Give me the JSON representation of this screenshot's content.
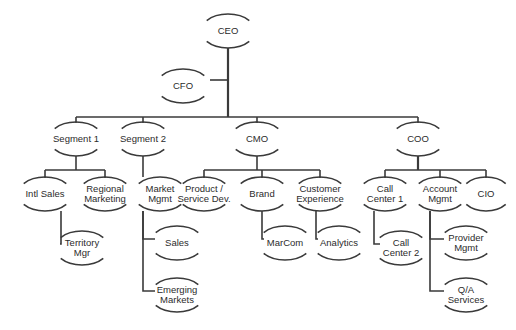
{
  "diagram": {
    "type": "org-chart",
    "canvas": {
      "width": 516,
      "height": 330
    },
    "style": {
      "background": "#ffffff",
      "line_color": "#3a3a3a",
      "text_color": "#2b2b2b",
      "line_width": 1.6,
      "trunk_width": 2.2,
      "font_size": 9.5,
      "line_height": 10.5,
      "node_rx": 27,
      "node_ry": 17,
      "arc_sweep_deg": 104
    },
    "nodes": [
      {
        "id": "ceo",
        "label": "CEO",
        "lines": [
          "CEO"
        ],
        "x": 228,
        "y": 31,
        "rx": 27,
        "ry": 17
      },
      {
        "id": "cfo",
        "label": "CFO",
        "lines": [
          "CFO"
        ],
        "x": 183,
        "y": 86,
        "rx": 27,
        "ry": 17
      },
      {
        "id": "segment1",
        "label": "Segment 1",
        "lines": [
          "Segment 1"
        ],
        "x": 76,
        "y": 139,
        "rx": 27,
        "ry": 17
      },
      {
        "id": "segment2",
        "label": "Segment 2",
        "lines": [
          "Segment 2"
        ],
        "x": 143,
        "y": 139,
        "rx": 27,
        "ry": 17
      },
      {
        "id": "cmo",
        "label": "CMO",
        "lines": [
          "CMO"
        ],
        "x": 257,
        "y": 139,
        "rx": 27,
        "ry": 17
      },
      {
        "id": "coo",
        "label": "COO",
        "lines": [
          "COO"
        ],
        "x": 418,
        "y": 139,
        "rx": 27,
        "ry": 17
      },
      {
        "id": "intlsales",
        "label": "Intl Sales",
        "lines": [
          "Intl Sales"
        ],
        "x": 45,
        "y": 194,
        "rx": 27,
        "ry": 17
      },
      {
        "id": "regmkt",
        "label": "Regional Marketing",
        "lines": [
          "Regional",
          "Marketing"
        ],
        "x": 105,
        "y": 194,
        "rx": 27,
        "ry": 17
      },
      {
        "id": "marketmgmt",
        "label": "Market Mgmt",
        "lines": [
          "Market",
          "Mgmt"
        ],
        "x": 160,
        "y": 194,
        "rx": 27,
        "ry": 17
      },
      {
        "id": "prodserv",
        "label": "Product / Service Dev.",
        "lines": [
          "Product /",
          "Service Dev."
        ],
        "x": 204,
        "y": 194,
        "rx": 27,
        "ry": 17
      },
      {
        "id": "brand",
        "label": "Brand",
        "lines": [
          "Brand"
        ],
        "x": 262,
        "y": 194,
        "rx": 27,
        "ry": 17
      },
      {
        "id": "custexp",
        "label": "Customer Experience",
        "lines": [
          "Customer",
          "Experience"
        ],
        "x": 320,
        "y": 194,
        "rx": 27,
        "ry": 17
      },
      {
        "id": "callctr1",
        "label": "Call Center 1",
        "lines": [
          "Call",
          "Center 1"
        ],
        "x": 385,
        "y": 194,
        "rx": 27,
        "ry": 17
      },
      {
        "id": "acctmgmt",
        "label": "Account Mgmt",
        "lines": [
          "Account",
          "Mgmt"
        ],
        "x": 440,
        "y": 194,
        "rx": 27,
        "ry": 17
      },
      {
        "id": "cio",
        "label": "CIO",
        "lines": [
          "CIO"
        ],
        "x": 486,
        "y": 194,
        "rx": 25,
        "ry": 17
      },
      {
        "id": "territory",
        "label": "Territory Mgr",
        "lines": [
          "Territory",
          "Mgr"
        ],
        "x": 82,
        "y": 248,
        "rx": 27,
        "ry": 17
      },
      {
        "id": "sales",
        "label": "Sales",
        "lines": [
          "Sales"
        ],
        "x": 177,
        "y": 243,
        "rx": 27,
        "ry": 17
      },
      {
        "id": "emerging",
        "label": "Emerging Markets",
        "lines": [
          "Emerging",
          "Markets"
        ],
        "x": 177,
        "y": 295,
        "rx": 27,
        "ry": 17
      },
      {
        "id": "marcom",
        "label": "MarCom",
        "lines": [
          "MarCom"
        ],
        "x": 285,
        "y": 243,
        "rx": 27,
        "ry": 17
      },
      {
        "id": "analytics",
        "label": "Analytics",
        "lines": [
          "Analytics"
        ],
        "x": 339,
        "y": 243,
        "rx": 27,
        "ry": 17
      },
      {
        "id": "callctr2",
        "label": "Call Center 2",
        "lines": [
          "Call",
          "Center 2"
        ],
        "x": 401,
        "y": 248,
        "rx": 27,
        "ry": 17
      },
      {
        "id": "providermgmt",
        "label": "Provider Mgmt",
        "lines": [
          "Provider",
          "Mgmt"
        ],
        "x": 466,
        "y": 243,
        "rx": 27,
        "ry": 17
      },
      {
        "id": "qaservices",
        "label": "Q/A Services",
        "lines": [
          "Q/A",
          "Services"
        ],
        "x": 466,
        "y": 295,
        "rx": 27,
        "ry": 17
      }
    ],
    "edges": [
      {
        "from": "ceo",
        "to": "cfo",
        "kind": "staff"
      },
      {
        "from": "ceo",
        "to": "segment1",
        "kind": "bus"
      },
      {
        "from": "ceo",
        "to": "segment2",
        "kind": "bus"
      },
      {
        "from": "ceo",
        "to": "cmo",
        "kind": "bus"
      },
      {
        "from": "ceo",
        "to": "coo",
        "kind": "bus"
      },
      {
        "from": "segment1",
        "to": "intlsales",
        "kind": "bus"
      },
      {
        "from": "segment1",
        "to": "regmkt",
        "kind": "bus"
      },
      {
        "from": "segment2",
        "to": "marketmgmt",
        "kind": "direct"
      },
      {
        "from": "cmo",
        "to": "prodserv",
        "kind": "bus"
      },
      {
        "from": "cmo",
        "to": "brand",
        "kind": "bus"
      },
      {
        "from": "cmo",
        "to": "custexp",
        "kind": "bus"
      },
      {
        "from": "coo",
        "to": "callctr1",
        "kind": "bus"
      },
      {
        "from": "coo",
        "to": "acctmgmt",
        "kind": "bus"
      },
      {
        "from": "coo",
        "to": "cio",
        "kind": "bus"
      },
      {
        "from": "intlsales",
        "to": "territory",
        "kind": "elbow"
      },
      {
        "from": "marketmgmt",
        "to": "sales",
        "kind": "elbow"
      },
      {
        "from": "marketmgmt",
        "to": "emerging",
        "kind": "elbow"
      },
      {
        "from": "brand",
        "to": "marcom",
        "kind": "elbow"
      },
      {
        "from": "custexp",
        "to": "analytics",
        "kind": "elbow"
      },
      {
        "from": "callctr1",
        "to": "callctr2",
        "kind": "elbow"
      },
      {
        "from": "acctmgmt",
        "to": "providermgmt",
        "kind": "elbow"
      },
      {
        "from": "acctmgmt",
        "to": "qaservices",
        "kind": "elbow"
      }
    ],
    "buses": [
      {
        "id": "bus-ceo",
        "parent": "ceo",
        "y": 117,
        "x1": 76,
        "x2": 418,
        "trunk_x": 228,
        "trunk_from": 48,
        "trunk_to": 117,
        "heavy": true
      },
      {
        "id": "bus-segment1",
        "parent": "segment1",
        "y": 170,
        "x1": 45,
        "x2": 105,
        "trunk_x": 76,
        "trunk_from": 156,
        "trunk_to": 170,
        "heavy": false
      },
      {
        "id": "bus-cmo",
        "parent": "cmo",
        "y": 170,
        "x1": 204,
        "x2": 320,
        "trunk_x": 257,
        "trunk_from": 156,
        "trunk_to": 170,
        "heavy": false
      },
      {
        "id": "bus-coo",
        "parent": "coo",
        "y": 170,
        "x1": 385,
        "x2": 486,
        "trunk_x": 418,
        "trunk_from": 156,
        "trunk_to": 170,
        "heavy": true
      }
    ],
    "staff_link": {
      "id": "staff-cfo",
      "from_x": 210,
      "to_x": 228,
      "y": 80
    },
    "elbows": [
      {
        "id": "elbow-territory",
        "spine_x": 61,
        "y_from": 211,
        "y_to": 244,
        "x_to": 60
      },
      {
        "id": "elbow-sales",
        "spine_x": 143,
        "y_from": 211,
        "y_to": 239,
        "x_to": 155
      },
      {
        "id": "elbow-emerging",
        "spine_x": 143,
        "y_from": 211,
        "y_to": 291,
        "x_to": 155
      },
      {
        "id": "elbow-marcom",
        "spine_x": 262,
        "y_from": 211,
        "y_to": 239,
        "x_to": 264
      },
      {
        "id": "elbow-analytics",
        "spine_x": 316,
        "y_from": 211,
        "y_to": 239,
        "x_to": 318,
        "hidden_spine": false
      },
      {
        "id": "elbow-callctr2",
        "spine_x": 374,
        "y_from": 211,
        "y_to": 244,
        "x_to": 380
      },
      {
        "id": "elbow-provider",
        "spine_x": 430,
        "y_from": 211,
        "y_to": 239,
        "x_to": 444
      },
      {
        "id": "elbow-qa",
        "spine_x": 430,
        "y_from": 211,
        "y_to": 291,
        "x_to": 444
      }
    ],
    "direct_links": [
      {
        "id": "direct-marketmgmt",
        "x": 143,
        "y_from": 156,
        "y_to": 177
      }
    ]
  }
}
